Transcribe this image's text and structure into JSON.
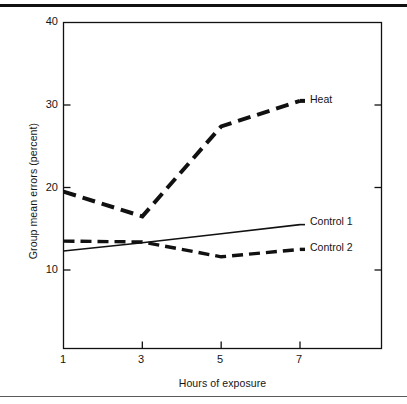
{
  "figure": {
    "background": "#ffffff",
    "ink_color": "#111111",
    "rule_top": true,
    "rule_bottom": true
  },
  "chart_data": {
    "type": "line",
    "title": "",
    "xlabel": "Hours of exposure",
    "ylabel": "Group mean errors (percent)",
    "x": [
      1,
      3,
      5,
      7
    ],
    "xticklabels": [
      "1",
      "3",
      "5",
      "7"
    ],
    "yticklabels": [
      "10",
      "20",
      "30",
      "40"
    ],
    "xlim": [
      0,
      9
    ],
    "ylim": [
      0,
      40
    ],
    "grid": false,
    "legend_position": "inline-right-of-series-end",
    "series": [
      {
        "name": "Heat",
        "label": "Heat",
        "style": "dashed",
        "linewidth": 4,
        "color": "#111111",
        "values": [
          19.5,
          16.5,
          27.4,
          30.5
        ]
      },
      {
        "name": "Control 1",
        "label": "Control 1",
        "style": "solid",
        "linewidth": 1.6,
        "color": "#111111",
        "values": [
          12.3,
          13.3,
          14.4,
          15.5
        ]
      },
      {
        "name": "Control 2",
        "label": "Control 2",
        "style": "dashed",
        "linewidth": 3.4,
        "color": "#111111",
        "values": [
          13.5,
          13.4,
          11.6,
          12.5
        ]
      }
    ]
  }
}
